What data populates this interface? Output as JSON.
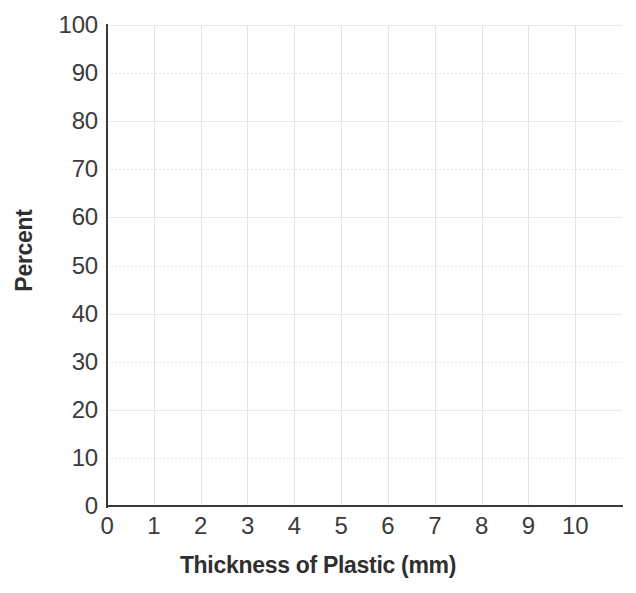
{
  "chart_data": {
    "type": "line",
    "title": "",
    "subtitle": "",
    "xlabel": "Thickness of Plastic (mm)",
    "ylabel": "Percent",
    "xlim": [
      0,
      11
    ],
    "ylim": [
      0,
      100
    ],
    "xticks": [
      "0",
      "1",
      "2",
      "3",
      "4",
      "5",
      "6",
      "7",
      "8",
      "9",
      "10"
    ],
    "xtick_values": [
      0,
      1,
      2,
      3,
      4,
      5,
      6,
      7,
      8,
      9,
      10
    ],
    "yticks": [
      "0",
      "10",
      "20",
      "30",
      "40",
      "50",
      "60",
      "70",
      "80",
      "90",
      "100"
    ],
    "ytick_values": [
      0,
      10,
      20,
      30,
      40,
      50,
      60,
      70,
      80,
      90,
      100
    ],
    "grid": true,
    "grid_color": "#e3e3e3",
    "axis_color": "#3a3a3a",
    "background_color": "#ffffff",
    "legend": [],
    "legend_position": "none",
    "annotations": [],
    "series": [],
    "note": "Empty grid; no data series plotted"
  },
  "figure": {
    "axis_title_color": "#2f2f2f",
    "tick_label_color": "#3b3b3b"
  }
}
